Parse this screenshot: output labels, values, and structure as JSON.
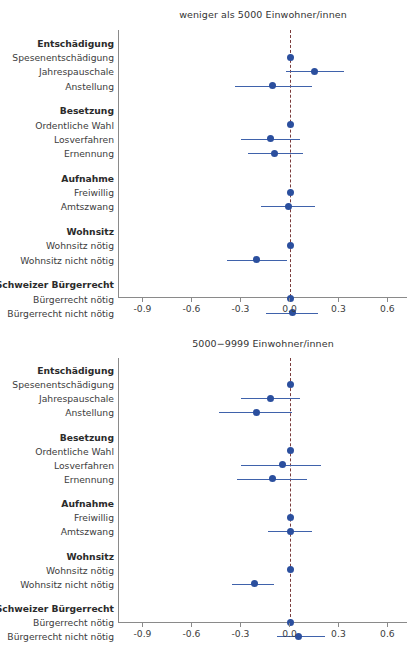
{
  "figure": {
    "x_axis": {
      "ticks": [
        -0.9,
        -0.6,
        -0.3,
        0.0,
        0.3,
        0.6
      ],
      "tick_labels": [
        "-0.9",
        "-0.6",
        "-0.3",
        "0.0",
        "0.3",
        "0.6"
      ],
      "min": -1.05,
      "max": 0.72,
      "zero_reference": 0.0
    },
    "colors": {
      "point": "#2b4f9e",
      "interval": "#3f62ab",
      "zero_line": "#7a3b3b",
      "axis": "#8a8a8a",
      "text": "#3c3c3c"
    },
    "rows": [
      {
        "label": "Entschädigung",
        "type": "group"
      },
      {
        "label": "Spesenentschädigung",
        "type": "reference"
      },
      {
        "label": "Jahrespauschale",
        "type": "estimate"
      },
      {
        "label": "Anstellung",
        "type": "estimate"
      },
      {
        "label": "",
        "type": "spacer"
      },
      {
        "label": "Besetzung",
        "type": "group"
      },
      {
        "label": "Ordentliche Wahl",
        "type": "reference"
      },
      {
        "label": "Losverfahren",
        "type": "estimate"
      },
      {
        "label": "Ernennung",
        "type": "estimate"
      },
      {
        "label": "",
        "type": "spacer"
      },
      {
        "label": "Aufnahme",
        "type": "group"
      },
      {
        "label": "Freiwillig",
        "type": "reference"
      },
      {
        "label": "Amtszwang",
        "type": "estimate"
      },
      {
        "label": "",
        "type": "spacer"
      },
      {
        "label": "Wohnsitz",
        "type": "group"
      },
      {
        "label": "Wohnsitz nötig",
        "type": "reference"
      },
      {
        "label": "Wohnsitz nicht nötig",
        "type": "estimate"
      },
      {
        "label": "",
        "type": "spacer"
      },
      {
        "label": "Schweizer Bürgerrecht",
        "type": "group"
      },
      {
        "label": "Bürgerrecht nötig",
        "type": "reference"
      },
      {
        "label": "Bürgerrecht nicht nötig",
        "type": "estimate"
      }
    ]
  },
  "chart_data": [
    {
      "type": "scatter",
      "title": "weniger als 5000 Einwohner/innen",
      "xlabel": "",
      "ylabel": "",
      "xlim": [
        -1.05,
        0.72
      ],
      "grid": false,
      "legend": "none",
      "zero_line": 0.0,
      "categories": [
        "Entschädigung",
        "Spesenentschädigung",
        "Jahrespauschale",
        "Anstellung",
        "Besetzung",
        "Ordentliche Wahl",
        "Losverfahren",
        "Ernennung",
        "Aufnahme",
        "Freiwillig",
        "Amtszwang",
        "Wohnsitz",
        "Wohnsitz nötig",
        "Wohnsitz nicht nötig",
        "Schweizer Bürgerrecht",
        "Bürgerrecht nötig",
        "Bürgerrecht nicht nötig"
      ],
      "points": [
        {
          "label": "Entschädigung",
          "group": true
        },
        {
          "label": "Spesenentschädigung",
          "estimate": 0.0,
          "ci_low": null,
          "ci_high": null
        },
        {
          "label": "Jahrespauschale",
          "estimate": 0.15,
          "ci_low": -0.03,
          "ci_high": 0.33
        },
        {
          "label": "Anstellung",
          "estimate": -0.11,
          "ci_low": -0.34,
          "ci_high": 0.13
        },
        {
          "label": "Besetzung",
          "group": true
        },
        {
          "label": "Ordentliche Wahl",
          "estimate": 0.0,
          "ci_low": null,
          "ci_high": null
        },
        {
          "label": "Losverfahren",
          "estimate": -0.12,
          "ci_low": -0.3,
          "ci_high": 0.06
        },
        {
          "label": "Ernennung",
          "estimate": -0.1,
          "ci_low": -0.26,
          "ci_high": 0.08
        },
        {
          "label": "Aufnahme",
          "group": true
        },
        {
          "label": "Freiwillig",
          "estimate": 0.0,
          "ci_low": null,
          "ci_high": null
        },
        {
          "label": "Amtszwang",
          "estimate": -0.01,
          "ci_low": -0.18,
          "ci_high": 0.15
        },
        {
          "label": "Wohnsitz",
          "group": true
        },
        {
          "label": "Wohnsitz nötig",
          "estimate": 0.0,
          "ci_low": null,
          "ci_high": null
        },
        {
          "label": "Wohnsitz nicht nötig",
          "estimate": -0.21,
          "ci_low": -0.39,
          "ci_high": -0.02
        },
        {
          "label": "Schweizer Bürgerrecht",
          "group": true
        },
        {
          "label": "Bürgerrecht nötig",
          "estimate": 0.0,
          "ci_low": null,
          "ci_high": null
        },
        {
          "label": "Bürgerrecht nicht nötig",
          "estimate": 0.01,
          "ci_low": -0.15,
          "ci_high": 0.17
        }
      ]
    },
    {
      "type": "scatter",
      "title": "5000−9999 Einwohner/innen",
      "xlabel": "",
      "ylabel": "",
      "xlim": [
        -1.05,
        0.72
      ],
      "grid": false,
      "legend": "none",
      "zero_line": 0.0,
      "categories": [
        "Entschädigung",
        "Spesenentschädigung",
        "Jahrespauschale",
        "Anstellung",
        "Besetzung",
        "Ordentliche Wahl",
        "Losverfahren",
        "Ernennung",
        "Aufnahme",
        "Freiwillig",
        "Amtszwang",
        "Wohnsitz",
        "Wohnsitz nötig",
        "Wohnsitz nicht nötig",
        "Schweizer Bürgerrecht",
        "Bürgerrecht nötig",
        "Bürgerrecht nicht nötig"
      ],
      "points": [
        {
          "label": "Entschädigung",
          "group": true
        },
        {
          "label": "Spesenentschädigung",
          "estimate": 0.0,
          "ci_low": null,
          "ci_high": null
        },
        {
          "label": "Jahrespauschale",
          "estimate": -0.12,
          "ci_low": -0.3,
          "ci_high": 0.06
        },
        {
          "label": "Anstellung",
          "estimate": -0.21,
          "ci_low": -0.44,
          "ci_high": 0.01
        },
        {
          "label": "Besetzung",
          "group": true
        },
        {
          "label": "Ordentliche Wahl",
          "estimate": 0.0,
          "ci_low": null,
          "ci_high": null
        },
        {
          "label": "Losverfahren",
          "estimate": -0.05,
          "ci_low": -0.3,
          "ci_high": 0.19
        },
        {
          "label": "Ernennung",
          "estimate": -0.11,
          "ci_low": -0.33,
          "ci_high": 0.1
        },
        {
          "label": "Aufnahme",
          "group": true
        },
        {
          "label": "Freiwillig",
          "estimate": 0.0,
          "ci_low": null,
          "ci_high": null
        },
        {
          "label": "Amtszwang",
          "estimate": 0.0,
          "ci_low": -0.14,
          "ci_high": 0.13
        },
        {
          "label": "Wohnsitz",
          "group": true
        },
        {
          "label": "Wohnsitz nötig",
          "estimate": 0.0,
          "ci_low": null,
          "ci_high": null
        },
        {
          "label": "Wohnsitz nicht nötig",
          "estimate": -0.22,
          "ci_low": -0.36,
          "ci_high": -0.1
        },
        {
          "label": "Schweizer Bürgerrecht",
          "group": true
        },
        {
          "label": "Bürgerrecht nötig",
          "estimate": 0.0,
          "ci_low": null,
          "ci_high": null
        },
        {
          "label": "Bürgerrecht nicht nötig",
          "estimate": 0.05,
          "ci_low": -0.08,
          "ci_high": 0.21
        }
      ]
    }
  ]
}
